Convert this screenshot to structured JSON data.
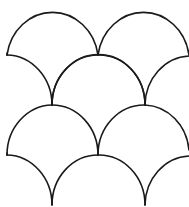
{
  "pattern": {
    "name": "fish-scale",
    "stroke_color": "#1a1a1a",
    "background_color": "#ffffff",
    "scales": [
      {
        "row": 1,
        "x1": 7,
        "x2": 98,
        "base_y": 55
      },
      {
        "row": 1,
        "x1": 98,
        "x2": 189,
        "base_y": 55
      },
      {
        "row": 2,
        "x1": 7,
        "x2": 52,
        "base_y": 105,
        "partial": "left"
      },
      {
        "row": 2,
        "x1": 52,
        "x2": 145,
        "base_y": 105
      },
      {
        "row": 2,
        "x1": 145,
        "x2": 189,
        "base_y": 105,
        "partial": "right"
      },
      {
        "row": 3,
        "x1": 7,
        "x2": 98,
        "base_y": 155
      },
      {
        "row": 3,
        "x1": 98,
        "x2": 189,
        "base_y": 155
      },
      {
        "row": 4,
        "x1": 7,
        "x2": 52,
        "base_y": 205,
        "partial": "left"
      },
      {
        "row": 4,
        "x1": 52,
        "x2": 145,
        "base_y": 205
      },
      {
        "row": 4,
        "x1": 145,
        "x2": 189,
        "base_y": 205,
        "partial": "right"
      }
    ]
  }
}
